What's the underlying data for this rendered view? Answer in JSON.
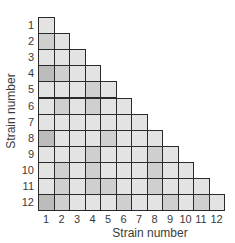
{
  "chart_data": {
    "type": "heatmap",
    "title": "",
    "xlabel": "Strain number",
    "ylabel": "Strain number",
    "x_ticks": [
      "1",
      "2",
      "3",
      "4",
      "5",
      "6",
      "7",
      "8",
      "9",
      "10",
      "11",
      "12"
    ],
    "y_ticks": [
      "1",
      "2",
      "3",
      "4",
      "5",
      "6",
      "7",
      "8",
      "9",
      "10",
      "11",
      "12"
    ],
    "shape": "lower-triangular",
    "shade_scale": {
      "0": "#e3e3e3",
      "1": "#cfcfcf",
      "2": "#bcbcbc"
    },
    "matrix": [
      [
        0
      ],
      [
        1,
        0
      ],
      [
        0,
        0,
        0
      ],
      [
        2,
        1,
        0,
        0
      ],
      [
        0,
        0,
        0,
        1,
        0
      ],
      [
        0,
        1,
        0,
        1,
        0,
        0
      ],
      [
        0,
        0,
        0,
        0,
        0,
        0,
        0
      ],
      [
        2,
        0,
        0,
        0,
        1,
        0,
        0,
        0
      ],
      [
        0,
        0,
        0,
        1,
        0,
        0,
        0,
        1,
        0
      ],
      [
        0,
        1,
        0,
        1,
        0,
        0,
        0,
        1,
        0,
        0
      ],
      [
        0,
        1,
        0,
        1,
        1,
        0,
        0,
        1,
        0,
        0,
        0
      ],
      [
        2,
        1,
        0,
        0,
        0,
        1,
        0,
        0,
        1,
        0,
        1,
        0
      ]
    ]
  }
}
